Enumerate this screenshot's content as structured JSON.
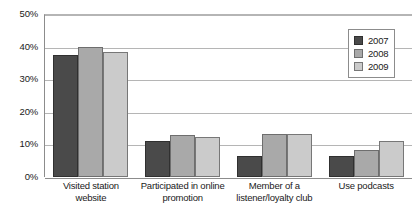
{
  "chart_data": {
    "type": "bar",
    "title": "",
    "subtitle": "",
    "xlabel": "",
    "ylabel": "",
    "ylim": [
      0,
      50
    ],
    "ytick_values": [
      50,
      40,
      30,
      20,
      10,
      0
    ],
    "ytick_labels": [
      "50%",
      "40%",
      "30%",
      "20%",
      "10%",
      "0%"
    ],
    "grid": true,
    "legend_position": "upper-right",
    "categories": [
      "Visited station website",
      "Participated in online promotion",
      "Member of a listener/loyalty club",
      "Use podcasts"
    ],
    "series": [
      {
        "name": "2007",
        "color": "#4a4a4a",
        "values": [
          37.5,
          11.0,
          6.5,
          6.5
        ]
      },
      {
        "name": "2008",
        "color": "#a9a9a9",
        "values": [
          40.0,
          13.0,
          13.2,
          8.2
        ]
      },
      {
        "name": "2009",
        "color": "#cbcbcb",
        "values": [
          38.5,
          12.4,
          13.2,
          11.2
        ]
      }
    ]
  },
  "legend": {
    "items": [
      {
        "label": "2007"
      },
      {
        "label": "2008"
      },
      {
        "label": "2009"
      }
    ]
  }
}
